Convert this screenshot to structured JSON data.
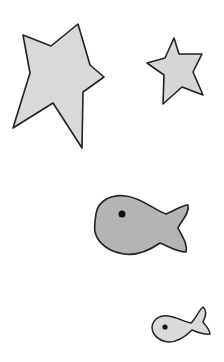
{
  "canvas": {
    "width": 224,
    "height": 362,
    "background": "#ffffff"
  },
  "shapes": [
    {
      "kind": "star",
      "label": "large irregular star",
      "fill": "#d9d9d9",
      "stroke": "#222222",
      "points": "23,35 51,46 78,24 90,65 104,77 83,92 82,148 53,103 13,128 30,73"
    },
    {
      "kind": "star",
      "label": "small star",
      "fill": "#d6d6d6",
      "stroke": "#222222",
      "points": "174,38 179,54 202,54 193,72 203,95 182,87 163,104 164,75 147,63 165,58"
    },
    {
      "kind": "fish",
      "label": "large fish",
      "fill": "#b4b4b4",
      "stroke": "#222222",
      "eye": {
        "cx": 122,
        "cy": 214,
        "r": 3.5
      }
    },
    {
      "kind": "fish",
      "label": "small fish",
      "fill": "#dadada",
      "stroke": "#222222",
      "eye": {
        "cx": 165,
        "cy": 327,
        "r": 2.6
      }
    }
  ]
}
